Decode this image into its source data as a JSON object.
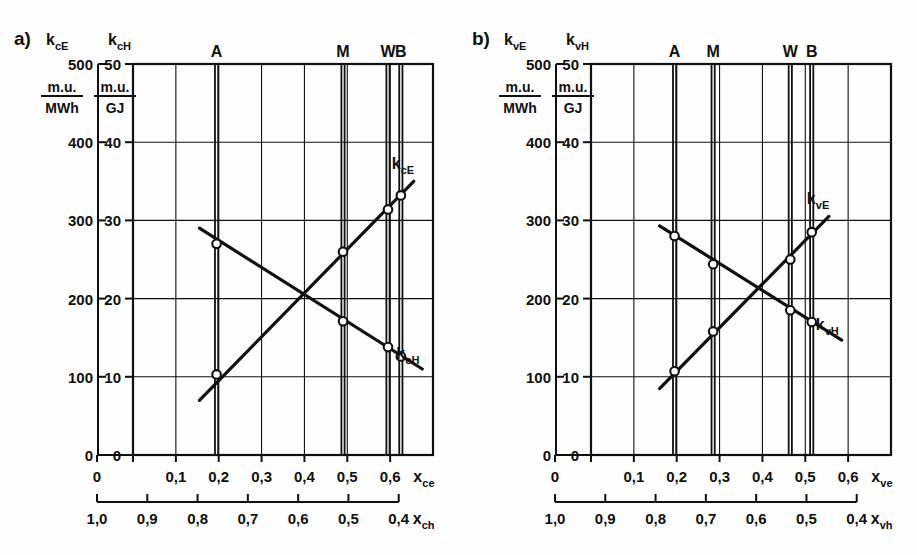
{
  "figure": {
    "background": "#fefefe",
    "ink": "#101010"
  },
  "panels": [
    {
      "id": "a",
      "panel_label": "a)",
      "axis_left_symbol": "k",
      "axis_left_sub": "cE",
      "axis_right_symbol": "k",
      "axis_right_sub": "cH",
      "unit_left_num": "m.u.",
      "unit_left_den": "MWh",
      "unit_right_num": "m.u.",
      "unit_right_den": "GJ",
      "y_left_ticks": [
        "500",
        "400",
        "300",
        "200",
        "100",
        "0"
      ],
      "y_right_ticks": [
        "50",
        "40",
        "30",
        "20",
        "10",
        "0"
      ],
      "x_top_ticks": [
        "0",
        "0,1",
        "0,2",
        "0,3",
        "0,4",
        "0,5",
        "0,6"
      ],
      "x_top_label_sym": "x",
      "x_top_label_sub": "ce",
      "x_bottom_ticks": [
        "1,0",
        "0,9",
        "0,8",
        "0,7",
        "0,6",
        "0,5",
        "0,4"
      ],
      "x_bottom_label_sym": "x",
      "x_bottom_label_sub": "ch",
      "markers": [
        {
          "name": "A",
          "x": 0.195
        },
        {
          "name": "M",
          "x": 0.49
        },
        {
          "name": "W",
          "x": 0.595
        },
        {
          "name": "B",
          "x": 0.625
        }
      ],
      "curve_label_rise_sym": "k",
      "curve_label_rise_sub": "cE",
      "curve_label_fall_sym": "k",
      "curve_label_fall_sub": "cH"
    },
    {
      "id": "b",
      "panel_label": "b)",
      "axis_left_symbol": "k",
      "axis_left_sub": "vE",
      "axis_right_symbol": "k",
      "axis_right_sub": "vH",
      "unit_left_num": "m.u.",
      "unit_left_den": "MWh",
      "unit_right_num": "m.u.",
      "unit_right_den": "GJ",
      "y_left_ticks": [
        "500",
        "400",
        "300",
        "200",
        "100",
        "0"
      ],
      "y_right_ticks": [
        "50",
        "40",
        "30",
        "20",
        "10",
        "0"
      ],
      "x_top_ticks": [
        "0",
        "0,1",
        "0,2",
        "0,3",
        "0,4",
        "0,5",
        "0,6"
      ],
      "x_top_label_sym": "x",
      "x_top_label_sub": "ve",
      "x_bottom_ticks": [
        "1,0",
        "0,9",
        "0,8",
        "0,7",
        "0,6",
        "0,5",
        "0,4"
      ],
      "x_bottom_label_sym": "x",
      "x_bottom_label_sub": "vh",
      "markers": [
        {
          "name": "A",
          "x": 0.195
        },
        {
          "name": "M",
          "x": 0.285
        },
        {
          "name": "W",
          "x": 0.465
        },
        {
          "name": "B",
          "x": 0.515
        }
      ],
      "curve_label_rise_sym": "k",
      "curve_label_rise_sub": "vE",
      "curve_label_fall_sym": "k",
      "curve_label_fall_sub": "vH"
    }
  ],
  "chart_data": [
    {
      "type": "line",
      "panel": "a",
      "title": "a)",
      "xlabel": "x_ce",
      "ylabel": "k_cE [m.u./MWh] ; k_cH [m.u./GJ]",
      "xlim": [
        0.0,
        0.7
      ],
      "ylim_left": [
        0,
        500
      ],
      "ylim_right": [
        0,
        50
      ],
      "grid": true,
      "legend": "inline-curve-labels",
      "x_secondary": {
        "label": "x_ch",
        "ticks": [
          1.0,
          0.9,
          0.8,
          0.7,
          0.6,
          0.5,
          0.4
        ],
        "relation": "x_ch = 1 - x_ce + 0.4"
      },
      "markers": {
        "A": 0.195,
        "M": 0.49,
        "W": 0.595,
        "B": 0.625
      },
      "series": [
        {
          "name": "k_cE",
          "direction": "rising",
          "unit_right": "m.u./GJ",
          "points": [
            {
              "marker": "A",
              "x": 0.195,
              "y_right": 10.3,
              "y_left": 103
            },
            {
              "marker": "M",
              "x": 0.49,
              "y_right": 26.0,
              "y_left": 260
            },
            {
              "marker": "W",
              "x": 0.595,
              "y_right": 31.4,
              "y_left": 314
            },
            {
              "marker": "B",
              "x": 0.625,
              "y_right": 33.2,
              "y_left": 332
            }
          ],
          "line_start": {
            "x": 0.155,
            "y_right": 7.0
          },
          "line_end": {
            "x": 0.655,
            "y_right": 35.0
          }
        },
        {
          "name": "k_cH",
          "direction": "falling",
          "unit_right": "m.u./GJ",
          "points": [
            {
              "marker": "A",
              "x": 0.195,
              "y_right": 27.0,
              "y_left": 270
            },
            {
              "marker": "M",
              "x": 0.49,
              "y_right": 17.1,
              "y_left": 171
            },
            {
              "marker": "W",
              "x": 0.595,
              "y_right": 13.8,
              "y_left": 138
            },
            {
              "marker": "B",
              "x": 0.625,
              "y_right": 12.6,
              "y_left": 126
            }
          ],
          "line_start": {
            "x": 0.155,
            "y_right": 29.0
          },
          "line_end": {
            "x": 0.675,
            "y_right": 11.0
          }
        }
      ]
    },
    {
      "type": "line",
      "panel": "b",
      "title": "b)",
      "xlabel": "x_ve",
      "ylabel": "k_vE [m.u./MWh] ; k_vH [m.u./GJ]",
      "xlim": [
        0.0,
        0.7
      ],
      "ylim_left": [
        0,
        500
      ],
      "ylim_right": [
        0,
        50
      ],
      "grid": true,
      "legend": "inline-curve-labels",
      "x_secondary": {
        "label": "x_vh",
        "ticks": [
          1.0,
          0.9,
          0.8,
          0.7,
          0.6,
          0.5,
          0.4
        ],
        "relation": "x_vh = 1 - x_ve + 0.4"
      },
      "markers": {
        "A": 0.195,
        "M": 0.285,
        "W": 0.465,
        "B": 0.515
      },
      "series": [
        {
          "name": "k_vE",
          "direction": "rising",
          "unit_right": "m.u./GJ",
          "points": [
            {
              "marker": "A",
              "x": 0.195,
              "y_right": 10.7,
              "y_left": 107
            },
            {
              "marker": "M",
              "x": 0.285,
              "y_right": 15.8,
              "y_left": 158
            },
            {
              "marker": "W",
              "x": 0.465,
              "y_right": 25.0,
              "y_left": 250
            },
            {
              "marker": "B",
              "x": 0.515,
              "y_right": 28.5,
              "y_left": 285
            }
          ],
          "line_start": {
            "x": 0.16,
            "y_right": 8.5
          },
          "line_end": {
            "x": 0.555,
            "y_right": 30.5
          }
        },
        {
          "name": "k_vH",
          "direction": "falling",
          "unit_right": "m.u./GJ",
          "points": [
            {
              "marker": "A",
              "x": 0.195,
              "y_right": 28.0,
              "y_left": 280
            },
            {
              "marker": "M",
              "x": 0.285,
              "y_right": 24.4,
              "y_left": 244
            },
            {
              "marker": "W",
              "x": 0.465,
              "y_right": 18.5,
              "y_left": 185
            },
            {
              "marker": "B",
              "x": 0.515,
              "y_right": 17.0,
              "y_left": 170
            }
          ],
          "line_start": {
            "x": 0.16,
            "y_right": 29.3
          },
          "line_end": {
            "x": 0.585,
            "y_right": 14.7
          }
        }
      ]
    }
  ]
}
